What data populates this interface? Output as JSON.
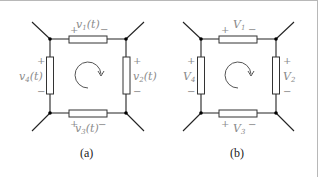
{
  "figure": {
    "panels": [
      {
        "caption": "(a)",
        "labels": {
          "v1": {
            "base": "v",
            "sub": "1",
            "arg": "(t)"
          },
          "v2": {
            "base": "v",
            "sub": "2",
            "arg": "(t)"
          },
          "v3": {
            "base": "v",
            "sub": "3",
            "arg": "(t)"
          },
          "v4": {
            "base": "v",
            "sub": "4",
            "arg": "(t)"
          }
        }
      },
      {
        "caption": "(b)",
        "labels": {
          "v1": {
            "base": "V",
            "sub": "1",
            "arg": ""
          },
          "v2": {
            "base": "V",
            "sub": "2",
            "arg": ""
          },
          "v3": {
            "base": "V",
            "sub": "3",
            "arg": ""
          },
          "v4": {
            "base": "V",
            "sub": "4",
            "arg": ""
          }
        }
      }
    ],
    "signs": {
      "plus": "+",
      "minus": "−"
    },
    "loop_direction": "clockwise"
  }
}
